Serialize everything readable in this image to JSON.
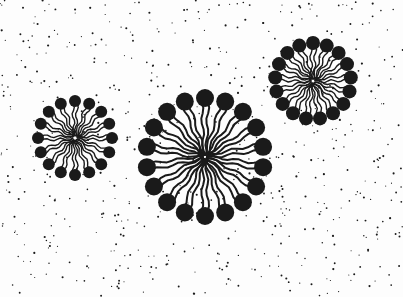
{
  "diagram": {
    "background_color": "#fdfdfd",
    "ink_color": "#1a1a1a",
    "dot_count": 650,
    "micelles": [
      {
        "name": "micelle-small-left",
        "cx": 75,
        "cy": 138,
        "ring_radius": 37,
        "head_radius": 6,
        "heads": 16,
        "tail_width": 1.4
      },
      {
        "name": "micelle-large-center",
        "cx": 205,
        "cy": 157,
        "ring_radius": 59,
        "head_radius": 9,
        "heads": 18,
        "tail_width": 2.0
      },
      {
        "name": "micelle-medium-right",
        "cx": 313,
        "cy": 81,
        "ring_radius": 38,
        "head_radius": 7,
        "heads": 17,
        "tail_width": 1.4
      }
    ]
  }
}
